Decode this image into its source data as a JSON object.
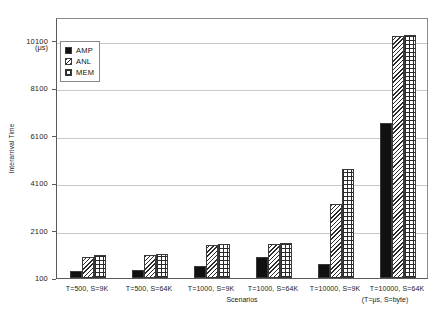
{
  "chart_data": {
    "type": "bar",
    "title": "",
    "xlabel": "Scenarios",
    "ylabel": "Interarrival Time",
    "yunit": "(μs)",
    "xunit_note": "(T=μs, S=byte)",
    "categories": [
      "T=500, S=9K",
      "T=500, S=64K",
      "T=1000, S=9K",
      "T=1000, S=64K",
      "T=10000, S=9K",
      "T=10000, S=64K"
    ],
    "series": [
      {
        "name": "AMP",
        "fill": "solid",
        "values": [
          400,
          420,
          600,
          1000,
          700,
          6650
        ]
      },
      {
        "name": "ANL",
        "fill": "diagonal",
        "values": [
          1000,
          1050,
          1500,
          1550,
          3200,
          10300
        ]
      },
      {
        "name": "MEM",
        "fill": "crosshatch",
        "values": [
          1050,
          1100,
          1520,
          1560,
          4700,
          10350
        ]
      }
    ],
    "ylim": [
      100,
      11100
    ],
    "yticks": [
      100,
      2100,
      4100,
      6100,
      8100,
      10100
    ],
    "ytick_labels": [
      "100",
      "2100",
      "4100",
      "6100",
      "8100",
      "10100"
    ],
    "grid": true,
    "legend_position": "upper-left-inside",
    "legend_entries": [
      "AMP",
      "ANL",
      "MEM"
    ],
    "colors": {
      "bar_outline": "#3a3a3a",
      "amp_fill": "#111111",
      "grid": "#c9c9c9",
      "axis": "#5a5a5a",
      "background": "#ffffff",
      "text": "#222222"
    }
  }
}
